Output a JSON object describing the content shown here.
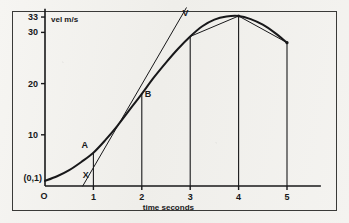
{
  "figure": {
    "title": "",
    "background_color": "#f3f2ef",
    "ink_color": "#18181a",
    "frame_color": "#3a3a38"
  },
  "axes": {
    "y_axis_label": "vel m/s",
    "x_axis_label": "time seconds",
    "origin_label": "O",
    "intercept_label": "(0,1)",
    "y_ticks": [
      {
        "value": 33,
        "label": "33"
      },
      {
        "value": 30,
        "label": "30"
      },
      {
        "value": 20,
        "label": "20"
      },
      {
        "value": 10,
        "label": "10"
      }
    ],
    "x_ticks": [
      {
        "value": 1,
        "label": "1"
      },
      {
        "value": 2,
        "label": "2"
      },
      {
        "value": 3,
        "label": "3"
      },
      {
        "value": 4,
        "label": "4"
      },
      {
        "value": 5,
        "label": "5"
      }
    ],
    "xlim": [
      0,
      5.7
    ],
    "ylim": [
      0,
      35
    ]
  },
  "annotations": [
    {
      "name": "point-a",
      "label": "A",
      "x": 1.0,
      "y": 6.5
    },
    {
      "name": "point-b",
      "label": "B",
      "x": 2.0,
      "y": 18.0
    },
    {
      "name": "tangent-foot",
      "label": "X",
      "x": 0.82,
      "y": 0.8
    },
    {
      "name": "tangent-head",
      "label": "V",
      "x": 2.88,
      "y": 34.2
    }
  ],
  "chart_data": {
    "type": "line",
    "title": "",
    "xlabel": "time seconds",
    "ylabel": "vel m/s",
    "xlim": [
      0,
      5.7
    ],
    "ylim": [
      0,
      35
    ],
    "grid": false,
    "legend": null,
    "series": [
      {
        "name": "velocity-curve",
        "style": "solid-thick",
        "x": [
          0.0,
          0.25,
          0.5,
          0.75,
          1.0,
          1.25,
          1.5,
          1.75,
          2.0,
          2.25,
          2.5,
          2.75,
          3.0,
          3.25,
          3.5,
          3.75,
          4.0,
          4.25,
          4.5,
          4.75,
          5.0
        ],
        "y": [
          1.0,
          1.9,
          3.1,
          4.7,
          6.5,
          9.0,
          11.8,
          14.9,
          18.0,
          21.2,
          24.1,
          26.8,
          29.2,
          31.2,
          32.5,
          33.1,
          33.2,
          32.6,
          31.5,
          29.9,
          28.0
        ]
      },
      {
        "name": "tangent-line-XV",
        "style": "solid-thin",
        "x": [
          0.78,
          2.92
        ],
        "y": [
          0.0,
          34.8
        ],
        "through_point": "A"
      },
      {
        "name": "chord-3-to-4",
        "style": "solid-thin",
        "x": [
          3.0,
          4.0
        ],
        "y": [
          29.2,
          33.2
        ]
      },
      {
        "name": "chord-4-to-5",
        "style": "solid-thin",
        "x": [
          4.0,
          5.0
        ],
        "y": [
          33.2,
          28.0
        ]
      }
    ],
    "ordinates": [
      {
        "name": "ordinate-1",
        "x": 1.0,
        "y_top": 6.5
      },
      {
        "name": "ordinate-2",
        "x": 2.0,
        "y_top": 18.0
      },
      {
        "name": "ordinate-3",
        "x": 3.0,
        "y_top": 29.2
      },
      {
        "name": "ordinate-4",
        "x": 4.0,
        "y_top": 33.2
      },
      {
        "name": "ordinate-5",
        "x": 5.0,
        "y_top": 28.0
      }
    ]
  }
}
